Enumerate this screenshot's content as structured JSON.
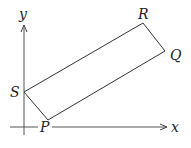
{
  "diagram": {
    "type": "coordinate-geometry",
    "axes": {
      "x_label": "x",
      "y_label": "y"
    },
    "shape": "quadrilateral (rectangle) PQRS",
    "vertices": [
      {
        "name": "P",
        "label": "P"
      },
      {
        "name": "Q",
        "label": "Q"
      },
      {
        "name": "R",
        "label": "R"
      },
      {
        "name": "S",
        "label": "S"
      }
    ],
    "colors": {
      "line": "#333333",
      "axis": "#444444",
      "background": "#ffffff"
    }
  }
}
